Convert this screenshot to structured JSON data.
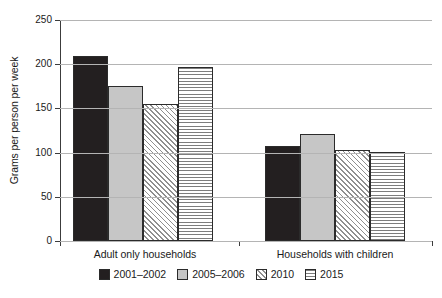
{
  "chart_data": {
    "type": "bar",
    "title": "",
    "subtitle": "",
    "xlabel": "",
    "ylabel": "Grams per person per week",
    "ylim": [
      0,
      250
    ],
    "yticks": [
      0,
      50,
      100,
      150,
      200,
      250
    ],
    "ytick_labels": [
      "0",
      "50",
      "100",
      "150",
      "200",
      "250"
    ],
    "grid": true,
    "grid_axis": "y",
    "legend_position": "bottom-center",
    "categories": [
      "Adult only households",
      "Households with children"
    ],
    "series": [
      {
        "name": "2001–2002",
        "values": [
          209,
          107
        ],
        "fill": "solid-dark",
        "color": "#231f20"
      },
      {
        "name": "2005–2006",
        "values": [
          175,
          121
        ],
        "fill": "solid-gray",
        "color": "#c6c6c6"
      },
      {
        "name": "2010",
        "values": [
          155,
          103
        ],
        "fill": "diagonal-hatch",
        "color": "#ffffff"
      },
      {
        "name": "2015",
        "values": [
          197,
          101
        ],
        "fill": "horizontal-lines",
        "color": "#ffffff"
      }
    ]
  },
  "colors": {
    "axis": "#3c3c3c",
    "gridline": "#b4b4b4",
    "text": "#1a1a1a",
    "background": "#ffffff",
    "bar_outline": "#2b2b2b"
  }
}
